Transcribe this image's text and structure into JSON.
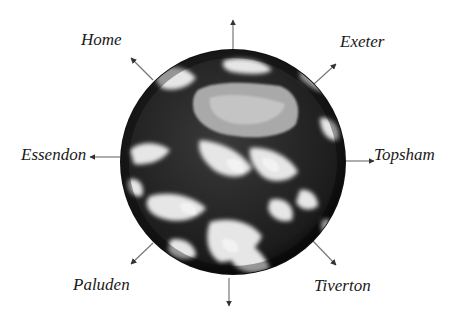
{
  "diagram": {
    "center": {
      "x": 233,
      "y": 162
    },
    "globe": {
      "name": "Earth",
      "radius": 112
    },
    "labels": [
      {
        "id": "home",
        "text": "Home",
        "x": 81,
        "y": 31
      },
      {
        "id": "exeter",
        "text": "Exeter",
        "x": 340,
        "y": 33
      },
      {
        "id": "essendon",
        "text": "Essendon",
        "x": 21,
        "y": 146
      },
      {
        "id": "topsham",
        "text": "Topsham",
        "x": 374,
        "y": 146
      },
      {
        "id": "paluden",
        "text": "Paluden",
        "x": 73,
        "y": 276
      },
      {
        "id": "tiverton",
        "text": "Tiverton",
        "x": 314,
        "y": 277
      }
    ],
    "arrows": [
      {
        "to": "north",
        "x1": 233,
        "y1": 49,
        "x2": 233,
        "y2": 20
      },
      {
        "to": "home",
        "x1": 153,
        "y1": 80,
        "x2": 131,
        "y2": 58
      },
      {
        "to": "exeter",
        "x1": 314,
        "y1": 84,
        "x2": 336,
        "y2": 64
      },
      {
        "to": "essendon",
        "x1": 122,
        "y1": 157,
        "x2": 90,
        "y2": 157
      },
      {
        "to": "topsham",
        "x1": 345,
        "y1": 161,
        "x2": 374,
        "y2": 161
      },
      {
        "to": "paluden",
        "x1": 153,
        "y1": 243,
        "x2": 131,
        "y2": 264
      },
      {
        "to": "tiverton",
        "x1": 312,
        "y1": 240,
        "x2": 336,
        "y2": 265
      },
      {
        "to": "south",
        "x1": 229,
        "y1": 278,
        "x2": 229,
        "y2": 306
      }
    ],
    "colors": {
      "arrow": "#777777",
      "label": "#1a1a1a",
      "background": "#ffffff"
    }
  }
}
